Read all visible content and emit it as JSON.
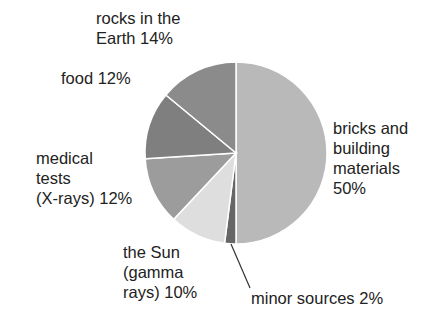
{
  "chart_data": {
    "type": "pie",
    "title": "",
    "start_angle_deg": 0,
    "direction": "clockwise",
    "slices": [
      {
        "label": "bricks and building materials",
        "value": 50,
        "color": "#b9b9b9"
      },
      {
        "label": "minor sources",
        "value": 2,
        "color": "#666666"
      },
      {
        "label": "the Sun (gamma rays)",
        "value": 10,
        "color": "#dedede"
      },
      {
        "label": "medical tests (X-rays)",
        "value": 12,
        "color": "#9c9c9c"
      },
      {
        "label": "food",
        "value": 12,
        "color": "#7f7f7f"
      },
      {
        "label": "rocks in the Earth",
        "value": 14,
        "color": "#8b8b8b"
      }
    ]
  },
  "labels": {
    "rocks": "rocks in the\nEarth 14%",
    "food": "food 12%",
    "medical": "medical\ntests\n(X-rays) 12%",
    "sun": "the Sun\n(gamma\nrays) 10%",
    "minor": "minor sources 2%",
    "bricks": "bricks and\nbuilding\nmaterials\n50%"
  }
}
